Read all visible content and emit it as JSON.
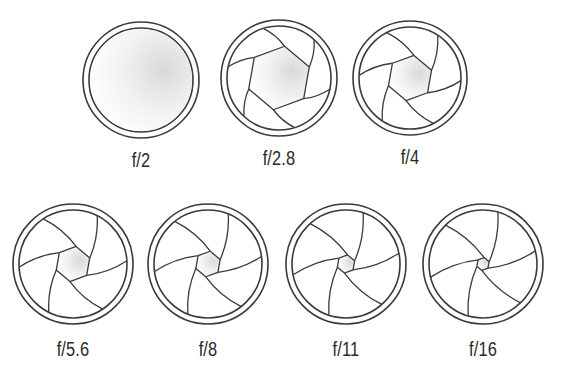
{
  "diagram": {
    "stroke_color": "#3a3a3a",
    "shade_color": "#d9d9d9",
    "apertures": [
      {
        "label": "f/2",
        "cx": 141,
        "cy": 80,
        "r": 58,
        "opening": 1.0,
        "row": 1
      },
      {
        "label": "f/2.8",
        "cx": 279,
        "cy": 78,
        "r": 58,
        "opening": 0.62,
        "row": 1
      },
      {
        "label": "f/4",
        "cx": 410,
        "cy": 78,
        "r": 57,
        "opening": 0.45,
        "row": 1
      },
      {
        "label": "f/5.6",
        "cx": 73,
        "cy": 264,
        "r": 60,
        "opening": 0.33,
        "row": 2
      },
      {
        "label": "f/8",
        "cx": 208,
        "cy": 264,
        "r": 60,
        "opening": 0.24,
        "row": 2
      },
      {
        "label": "f/11",
        "cx": 346,
        "cy": 264,
        "r": 60,
        "opening": 0.17,
        "row": 2
      },
      {
        "label": "f/16",
        "cx": 483,
        "cy": 264,
        "r": 60,
        "opening": 0.12,
        "row": 2
      }
    ]
  }
}
